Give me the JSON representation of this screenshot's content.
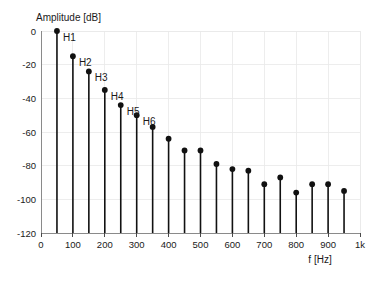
{
  "chart_data": {
    "type": "bar",
    "title": "",
    "xlabel": "f [Hz]",
    "ylabel": "Amplitude [dB]",
    "xlim": [
      0,
      1000
    ],
    "ylim": [
      -120,
      0
    ],
    "grid": true,
    "legend": null,
    "x_tick_labels": [
      "0",
      "100",
      "200",
      "300",
      "400",
      "500",
      "600",
      "700",
      "800",
      "900",
      "1k"
    ],
    "x_tick_values": [
      0,
      100,
      200,
      300,
      400,
      500,
      600,
      700,
      800,
      900,
      1000
    ],
    "y_tick_labels": [
      "0",
      "-20",
      "-40",
      "-60",
      "-80",
      "-100",
      "-120"
    ],
    "y_tick_values": [
      0,
      -20,
      -40,
      -60,
      -80,
      -100,
      -120
    ],
    "x": [
      50,
      100,
      150,
      200,
      250,
      300,
      350,
      400,
      450,
      500,
      550,
      600,
      650,
      700,
      750,
      800,
      850,
      900,
      950
    ],
    "values": [
      0,
      -15,
      -24,
      -35,
      -44,
      -50,
      -57,
      -64,
      -71,
      -71,
      -79,
      -82,
      -83,
      -91,
      -87,
      -96,
      -91,
      -91,
      -95
    ],
    "annotations": [
      {
        "label": "H1",
        "x": 50,
        "y": 0
      },
      {
        "label": "H2",
        "x": 100,
        "y": -15
      },
      {
        "label": "H3",
        "x": 150,
        "y": -24
      },
      {
        "label": "H4",
        "x": 200,
        "y": -35
      },
      {
        "label": "H5",
        "x": 250,
        "y": -44
      },
      {
        "label": "H6",
        "x": 300,
        "y": -50
      }
    ]
  }
}
